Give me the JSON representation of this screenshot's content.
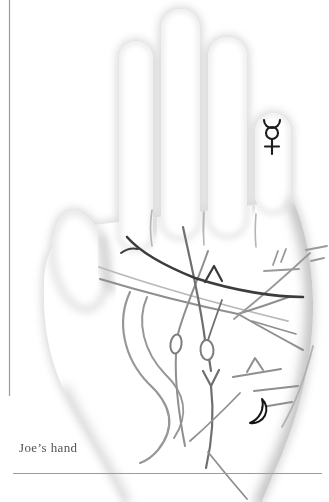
{
  "page": {
    "background": "#ffffff",
    "caption": "Joe’s hand",
    "caption_color": "#56534b",
    "rule_color": "#9b9b9b"
  },
  "hand": {
    "fill": "#ffffff",
    "shading": "#c8c8c8",
    "halo": "#d2d2d2"
  },
  "symbols": {
    "mercury": {
      "label": "Mercury symbol on little finger",
      "glyph": "☿",
      "color": "#1c1c1c"
    },
    "moon": {
      "label": "Crescent moon on lower palm",
      "glyph": "☽",
      "color": "#161616"
    }
  },
  "lines": {
    "heart": "#3c3c3c",
    "fate": "#6f6f6f",
    "head": "#8f8f8f",
    "head_light": "#b9b9b9",
    "life": "#979797",
    "minor": "#9a9a9a",
    "faint": "#b2b2b2",
    "crease": "#b5b5b5",
    "island": "#7d7d7d",
    "dark_mark": "#3a3a3a"
  }
}
